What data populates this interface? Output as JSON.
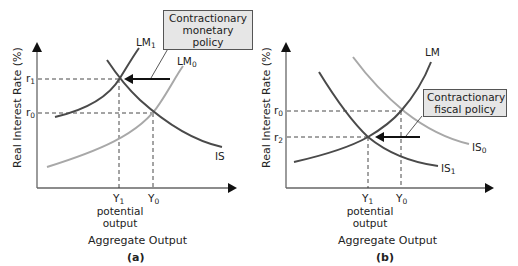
{
  "panels": {
    "a": {
      "tag": "(a)",
      "y_axis_label": "Real Interest Rate (%)",
      "x_axis_label": "Aggregate Output",
      "potential_label_1": "potential",
      "potential_label_2": "output",
      "callout_line1": "Contractionary",
      "callout_line2": "monetary policy",
      "curves": {
        "lm1": {
          "base": "LM",
          "sub": "1"
        },
        "lm0": {
          "base": "LM",
          "sub": "0"
        },
        "is": {
          "base": "IS",
          "sub": ""
        }
      },
      "y_ticks": {
        "r1": {
          "base": "r",
          "sub": "1"
        },
        "r0": {
          "base": "r",
          "sub": "0"
        }
      },
      "x_ticks": {
        "y1": {
          "base": "Y",
          "sub": "1"
        },
        "y0": {
          "base": "Y",
          "sub": "0"
        }
      }
    },
    "b": {
      "tag": "(b)",
      "y_axis_label": "Real Interest Rate (%)",
      "x_axis_label": "Aggregate Output",
      "potential_label_1": "potential",
      "potential_label_2": "output",
      "callout_line1": "Contractionary",
      "callout_line2": "fiscal policy",
      "curves": {
        "lm": {
          "base": "LM",
          "sub": ""
        },
        "is0": {
          "base": "IS",
          "sub": "0"
        },
        "is1": {
          "base": "IS",
          "sub": "1"
        }
      },
      "y_ticks": {
        "r0": {
          "base": "r",
          "sub": "0"
        },
        "r2": {
          "base": "r",
          "sub": "2"
        }
      },
      "x_ticks": {
        "y1": {
          "base": "Y",
          "sub": "1"
        },
        "y0": {
          "base": "Y",
          "sub": "0"
        }
      }
    }
  },
  "colors": {
    "dark_curve": "#4a4a4a",
    "light_curve": "#a8a8a8",
    "axis": "#555555",
    "callout_bg": "#e6e6e6"
  }
}
